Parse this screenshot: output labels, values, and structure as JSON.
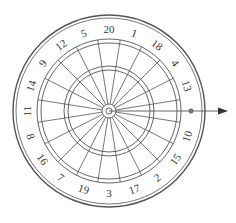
{
  "diagram": {
    "type": "dartboard",
    "center": [
      109,
      111
    ],
    "numbers_clockwise_from_top": [
      "20",
      "1",
      "18",
      "4",
      "13",
      "6",
      "10",
      "15",
      "2",
      "17",
      "3",
      "19",
      "7",
      "16",
      "8",
      "11",
      "14",
      "9",
      "12",
      "5"
    ],
    "hidden_number": "6",
    "radii": {
      "outer_rim_outer": 96,
      "outer_rim_inner": 93,
      "number_ring": 82,
      "double_outer": 72,
      "double_inner": 68,
      "triple_outer": 45,
      "triple_inner": 41,
      "outer_bull": 7,
      "inner_bull": 3
    },
    "marker": {
      "label": "dart-position-marker",
      "position": [
        191,
        111
      ]
    },
    "arrow": {
      "from": [
        109,
        111
      ],
      "to": [
        228,
        111
      ]
    },
    "colors": {
      "line": "#555555",
      "text": "#333333",
      "background": "#ffffff"
    }
  }
}
